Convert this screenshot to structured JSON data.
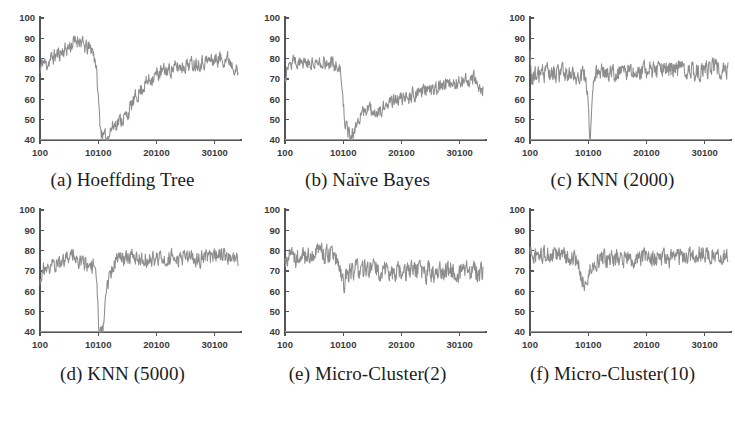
{
  "figure": {
    "background": "#ffffff",
    "line_color": "#8d8d8d",
    "axis_color": "#555555",
    "columns": 3,
    "rows": 2
  },
  "captions": {
    "a": "(a) Hoeffding Tree",
    "b": "(b) Naïve Bayes",
    "c": "(c) KNN (2000)",
    "d": "(d) KNN (5000)",
    "e": "(e) Micro-Cluster(2)",
    "f": "(f) Micro-Cluster(10)"
  },
  "axes": {
    "yticks": [
      "100",
      "90",
      "80",
      "70",
      "60",
      "50",
      "40"
    ],
    "xticks": [
      "100",
      "10100",
      "20100",
      "30100"
    ],
    "ylim": [
      40,
      100
    ],
    "xlim": [
      100,
      34100
    ],
    "xtick_values": [
      100,
      10100,
      20100,
      30100
    ],
    "ytick_values": [
      100,
      90,
      80,
      70,
      60,
      50,
      40
    ],
    "grid": false
  },
  "chart_data": [
    {
      "id": "a",
      "type": "line",
      "title": "(a) Hoeffding Tree",
      "xlabel": "",
      "ylabel": "",
      "xlim": [
        100,
        34100
      ],
      "ylim": [
        40,
        100
      ],
      "xticks": [
        100,
        10100,
        20100,
        30100
      ],
      "yticks": [
        40,
        50,
        60,
        70,
        80,
        90,
        100
      ],
      "grid": false,
      "legend": "none",
      "series": [
        {
          "name": "accuracy",
          "color": "#8d8d8d",
          "noise": 3.4,
          "seed": 11,
          "control_points": [
            [
              100,
              73
            ],
            [
              500,
              79
            ],
            [
              1200,
              77
            ],
            [
              2000,
              80
            ],
            [
              3000,
              82
            ],
            [
              4200,
              84
            ],
            [
              5200,
              86
            ],
            [
              6000,
              88
            ],
            [
              6800,
              90
            ],
            [
              7600,
              86
            ],
            [
              8400,
              85
            ],
            [
              9000,
              85
            ],
            [
              9600,
              80
            ],
            [
              10000,
              66
            ],
            [
              10300,
              52
            ],
            [
              10600,
              44
            ],
            [
              11000,
              41
            ],
            [
              11600,
              41
            ],
            [
              12200,
              45
            ],
            [
              13000,
              48
            ],
            [
              14000,
              50
            ],
            [
              15000,
              52
            ],
            [
              16000,
              58
            ],
            [
              17000,
              63
            ],
            [
              18000,
              67
            ],
            [
              19000,
              70
            ],
            [
              20000,
              72
            ],
            [
              21500,
              74
            ],
            [
              23000,
              75
            ],
            [
              25000,
              77
            ],
            [
              27000,
              78
            ],
            [
              29000,
              79
            ],
            [
              31000,
              80
            ],
            [
              32500,
              80
            ],
            [
              33600,
              76
            ],
            [
              34100,
              72
            ]
          ]
        }
      ]
    },
    {
      "id": "b",
      "type": "line",
      "title": "(b) Naïve Bayes",
      "xlabel": "",
      "ylabel": "",
      "xlim": [
        100,
        34100
      ],
      "ylim": [
        40,
        100
      ],
      "xticks": [
        100,
        10100,
        20100,
        30100
      ],
      "yticks": [
        40,
        50,
        60,
        70,
        80,
        90,
        100
      ],
      "grid": false,
      "legend": "none",
      "series": [
        {
          "name": "accuracy",
          "color": "#8d8d8d",
          "noise": 3.2,
          "seed": 27,
          "control_points": [
            [
              100,
              71
            ],
            [
              600,
              78
            ],
            [
              1500,
              79
            ],
            [
              2500,
              78
            ],
            [
              3500,
              79
            ],
            [
              4500,
              78
            ],
            [
              5500,
              79
            ],
            [
              6500,
              78
            ],
            [
              7500,
              78
            ],
            [
              8500,
              77
            ],
            [
              9200,
              77
            ],
            [
              9700,
              73
            ],
            [
              10000,
              63
            ],
            [
              10300,
              52
            ],
            [
              10700,
              45
            ],
            [
              11200,
              42
            ],
            [
              11900,
              44
            ],
            [
              12600,
              49
            ],
            [
              13400,
              53
            ],
            [
              14200,
              55
            ],
            [
              15200,
              54
            ],
            [
              16200,
              55
            ],
            [
              17200,
              56
            ],
            [
              18200,
              58
            ],
            [
              19200,
              60
            ],
            [
              20200,
              61
            ],
            [
              21500,
              62
            ],
            [
              23000,
              63
            ],
            [
              25000,
              65
            ],
            [
              27000,
              67
            ],
            [
              29000,
              68
            ],
            [
              31000,
              69
            ],
            [
              32600,
              70
            ],
            [
              33500,
              66
            ],
            [
              34100,
              64
            ]
          ]
        }
      ]
    },
    {
      "id": "c",
      "type": "line",
      "title": "(c) KNN (2000)",
      "xlabel": "",
      "ylabel": "",
      "xlim": [
        100,
        34100
      ],
      "ylim": [
        40,
        100
      ],
      "xticks": [
        100,
        10100,
        20100,
        30100
      ],
      "yticks": [
        40,
        50,
        60,
        70,
        80,
        90,
        100
      ],
      "grid": false,
      "legend": "none",
      "series": [
        {
          "name": "accuracy",
          "color": "#8d8d8d",
          "noise": 4.0,
          "seed": 43,
          "control_points": [
            [
              100,
              80
            ],
            [
              400,
              72
            ],
            [
              1500,
              72
            ],
            [
              3000,
              73
            ],
            [
              4500,
              72
            ],
            [
              6000,
              73
            ],
            [
              7500,
              72
            ],
            [
              9000,
              72
            ],
            [
              9700,
              71
            ],
            [
              10000,
              62
            ],
            [
              10200,
              50
            ],
            [
              10400,
              41
            ],
            [
              10600,
              45
            ],
            [
              10900,
              62
            ],
            [
              11200,
              71
            ],
            [
              12000,
              73
            ],
            [
              14000,
              73
            ],
            [
              16000,
              74
            ],
            [
              18000,
              73
            ],
            [
              20000,
              74
            ],
            [
              22000,
              74
            ],
            [
              24000,
              75
            ],
            [
              26000,
              75
            ],
            [
              28000,
              74
            ],
            [
              30000,
              74
            ],
            [
              31500,
              76
            ],
            [
              33000,
              74
            ],
            [
              34100,
              74
            ]
          ]
        }
      ]
    },
    {
      "id": "d",
      "type": "line",
      "title": "(d) KNN (5000)",
      "xlabel": "",
      "ylabel": "",
      "xlim": [
        100,
        34100
      ],
      "ylim": [
        40,
        100
      ],
      "xticks": [
        100,
        10100,
        20100,
        30100
      ],
      "yticks": [
        40,
        50,
        60,
        70,
        80,
        90,
        100
      ],
      "grid": false,
      "legend": "none",
      "series": [
        {
          "name": "accuracy",
          "color": "#8d8d8d",
          "noise": 3.6,
          "seed": 59,
          "control_points": [
            [
              100,
              64
            ],
            [
              500,
              71
            ],
            [
              1500,
              72
            ],
            [
              2500,
              73
            ],
            [
              3500,
              74
            ],
            [
              4500,
              76
            ],
            [
              5200,
              79
            ],
            [
              6000,
              78
            ],
            [
              6800,
              76
            ],
            [
              7600,
              74
            ],
            [
              8400,
              73
            ],
            [
              9200,
              72
            ],
            [
              9800,
              70
            ],
            [
              10000,
              58
            ],
            [
              10150,
              44
            ],
            [
              10300,
              41
            ],
            [
              10900,
              41
            ],
            [
              11100,
              46
            ],
            [
              11400,
              56
            ],
            [
              11800,
              64
            ],
            [
              12300,
              70
            ],
            [
              13000,
              75
            ],
            [
              14000,
              76
            ],
            [
              16000,
              77
            ],
            [
              18000,
              76
            ],
            [
              20000,
              76
            ],
            [
              22000,
              77
            ],
            [
              24000,
              76
            ],
            [
              26000,
              76
            ],
            [
              28000,
              76
            ],
            [
              30000,
              77
            ],
            [
              32000,
              78
            ],
            [
              33500,
              76
            ],
            [
              34100,
              76
            ]
          ]
        }
      ]
    },
    {
      "id": "e",
      "type": "line",
      "title": "(e) Micro-Cluster(2)",
      "xlabel": "",
      "ylabel": "",
      "xlim": [
        100,
        34100
      ],
      "ylim": [
        40,
        100
      ],
      "xticks": [
        100,
        10100,
        20100,
        30100
      ],
      "yticks": [
        40,
        50,
        60,
        70,
        80,
        90,
        100
      ],
      "grid": false,
      "legend": "none",
      "series": [
        {
          "name": "accuracy",
          "color": "#8d8d8d",
          "noise": 4.6,
          "seed": 71,
          "control_points": [
            [
              100,
              74
            ],
            [
              700,
              77
            ],
            [
              1600,
              77
            ],
            [
              2600,
              78
            ],
            [
              3600,
              77
            ],
            [
              4600,
              78
            ],
            [
              5400,
              79
            ],
            [
              6200,
              80
            ],
            [
              7000,
              78
            ],
            [
              7800,
              77
            ],
            [
              8600,
              76
            ],
            [
              9300,
              74
            ],
            [
              9800,
              69
            ],
            [
              10100,
              64
            ],
            [
              10500,
              66
            ],
            [
              11200,
              70
            ],
            [
              12200,
              71
            ],
            [
              13500,
              70
            ],
            [
              15000,
              71
            ],
            [
              16500,
              70
            ],
            [
              18000,
              70
            ],
            [
              19500,
              70
            ],
            [
              21000,
              69
            ],
            [
              22500,
              70
            ],
            [
              24000,
              70
            ],
            [
              25500,
              69
            ],
            [
              27000,
              70
            ],
            [
              28500,
              70
            ],
            [
              30000,
              69
            ],
            [
              31500,
              70
            ],
            [
              33000,
              69
            ],
            [
              34100,
              69
            ]
          ]
        }
      ]
    },
    {
      "id": "f",
      "type": "line",
      "title": "(f) Micro-Cluster(10)",
      "xlabel": "",
      "ylabel": "",
      "xlim": [
        100,
        34100
      ],
      "ylim": [
        40,
        100
      ],
      "xticks": [
        100,
        10100,
        20100,
        30100
      ],
      "yticks": [
        40,
        50,
        60,
        70,
        80,
        90,
        100
      ],
      "grid": false,
      "legend": "none",
      "series": [
        {
          "name": "accuracy",
          "color": "#8d8d8d",
          "noise": 3.9,
          "seed": 97,
          "control_points": [
            [
              100,
              81
            ],
            [
              600,
              77
            ],
            [
              1500,
              77
            ],
            [
              2500,
              78
            ],
            [
              3500,
              77
            ],
            [
              4500,
              78
            ],
            [
              5500,
              78
            ],
            [
              6500,
              77
            ],
            [
              7500,
              76
            ],
            [
              8400,
              73
            ],
            [
              9000,
              67
            ],
            [
              9500,
              63
            ],
            [
              9900,
              65
            ],
            [
              10400,
              70
            ],
            [
              11200,
              74
            ],
            [
              12200,
              76
            ],
            [
              13500,
              75
            ],
            [
              15000,
              76
            ],
            [
              16500,
              76
            ],
            [
              18000,
              76
            ],
            [
              19500,
              77
            ],
            [
              21000,
              76
            ],
            [
              22500,
              77
            ],
            [
              24000,
              76
            ],
            [
              25500,
              77
            ],
            [
              27000,
              77
            ],
            [
              28500,
              78
            ],
            [
              30000,
              79
            ],
            [
              31500,
              78
            ],
            [
              33000,
              78
            ],
            [
              34100,
              77
            ]
          ]
        }
      ]
    }
  ]
}
